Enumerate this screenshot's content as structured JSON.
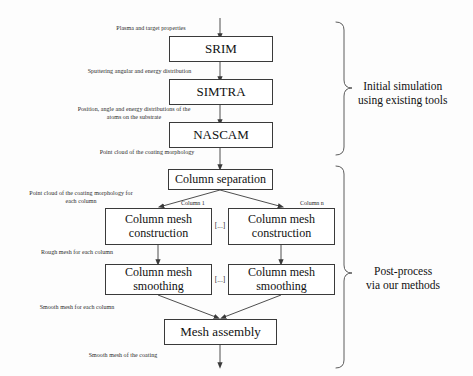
{
  "diagram": {
    "nodes": {
      "srim": "SRIM",
      "simtra": "SIMTRA",
      "nascam": "NASCAM",
      "column_separation": "Column separation",
      "column_mesh_construction_left_line1": "Column mesh",
      "column_mesh_construction_left_line2": "construction",
      "column_mesh_construction_right_line1": "Column mesh",
      "column_mesh_construction_right_line2": "construction",
      "column_mesh_smoothing_left_line1": "Column mesh",
      "column_mesh_smoothing_left_line2": "smoothing",
      "column_mesh_smoothing_right_line1": "Column mesh",
      "column_mesh_smoothing_right_line2": "smoothing",
      "mesh_assembly": "Mesh assembly"
    },
    "edge_labels": {
      "input_to_srim": "Plasma and target properties",
      "srim_to_simtra": "Sputtering angular and energy distribution",
      "simtra_to_nascam_line1": "Position, angle and energy distributions of the",
      "simtra_to_nascam_line2": "atoms on the substrate",
      "nascam_to_separation": "Point cloud of the coating morphology",
      "separation_to_construction_line1": "Point cloud of the coating morphology for",
      "separation_to_construction_line2": "each column",
      "construction_to_smoothing": "Rough mesh for each column",
      "smoothing_to_assembly": "Smooth mesh for each column",
      "assembly_output": "Smooth mesh of the coating"
    },
    "branch_labels": {
      "column_first": "Column 1",
      "column_last": "Column n"
    },
    "ellipsis": {
      "construction_row": "[...]",
      "smoothing_row": "[...]"
    },
    "groups": {
      "initial_line1": "Initial simulation",
      "initial_line2": "using existing tools",
      "postprocess_line1": "Post-process",
      "postprocess_line2": "via our methods"
    },
    "colors": {
      "stroke": "#3a3a3a",
      "text": "#111111",
      "background": "#fdfdfd"
    }
  }
}
